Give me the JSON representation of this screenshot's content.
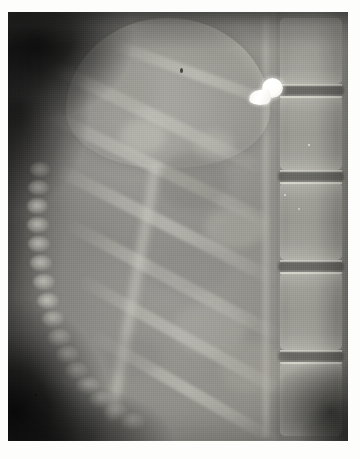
{
  "image": {
    "kind": "radiograph",
    "modality": "X-ray",
    "view": "lateral",
    "body_region": "abdomen / thoracolumbar spine",
    "subject": "infant",
    "caption": "",
    "border_color": "#ffffff",
    "plate": {
      "left": 8,
      "top": 12,
      "width": 340,
      "height": 429,
      "background_color": "#6f6f6f"
    }
  },
  "findings": {
    "foreign_body": {
      "label": "radiopaque-foreign-body",
      "shape": "mushroom / screw shaped",
      "color": "#ffffff",
      "x": 258,
      "y": 82
    },
    "spine": {
      "label": "vertebral-column",
      "side": "right",
      "vertebra_count": 5,
      "vertebrae": [
        {
          "top": 6,
          "height": 66
        },
        {
          "top": 84,
          "height": 74
        },
        {
          "top": 170,
          "height": 78
        },
        {
          "top": 260,
          "height": 78
        },
        {
          "top": 350,
          "height": 74
        }
      ],
      "discs": [
        {
          "top": 74
        },
        {
          "top": 160
        },
        {
          "top": 250
        },
        {
          "top": 340
        }
      ]
    },
    "ribs": {
      "label": "rib-cage",
      "side": "left",
      "bead_count": 16,
      "band_count": 6
    },
    "air_regions": [
      {
        "name": "upper-left-lucency",
        "x": 28,
        "y": 26
      },
      {
        "name": "lower-left-lucency",
        "x": 14,
        "y": 400
      },
      {
        "name": "lower-right-lucency",
        "x": 322,
        "y": 400
      }
    ],
    "soft_tissue": {
      "label": "abdominal-soft-tissue",
      "dome": {
        "name": "diaphragm-organ-dome",
        "x": 160,
        "y": 80
      }
    }
  },
  "tones": {
    "highlight": "#ffffff",
    "bone": "#cfcec6",
    "soft_tissue": "#9a9992",
    "mid": "#6f6f6c",
    "shadow": "#232322",
    "air": "#0c0c0c"
  }
}
